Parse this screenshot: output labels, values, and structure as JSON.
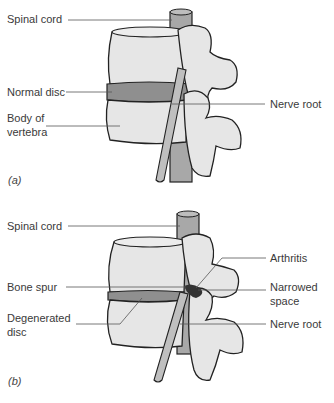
{
  "figure": {
    "panels": [
      {
        "id": "a",
        "caption": "(a)",
        "labels": {
          "spinal_cord": "Spinal cord",
          "normal_disc": "Normal disc",
          "body_of_vertebra_line1": "Body of",
          "body_of_vertebra_line2": "vertebra",
          "nerve_root": "Nerve root"
        }
      },
      {
        "id": "b",
        "caption": "(b)",
        "labels": {
          "spinal_cord": "Spinal cord",
          "bone_spur": "Bone spur",
          "degenerated_disc_line1": "Degenerated",
          "degenerated_disc_line2": "disc",
          "arthritis": "Arthritis",
          "narrowed_space_line1": "Narrowed",
          "narrowed_space_line2": "space",
          "nerve_root": "Nerve root"
        }
      }
    ],
    "colors": {
      "bone_fill": "#e6e6e6",
      "outline": "#222222",
      "disc_fill": "#8f8f8f",
      "cord_fill": "#a8a8a8",
      "leader_line": "#555555",
      "background": "#ffffff"
    }
  }
}
